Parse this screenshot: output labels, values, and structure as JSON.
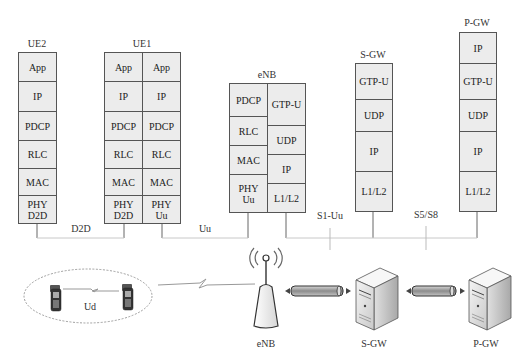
{
  "nodes": {
    "ue2": {
      "label": "UE2",
      "columns": [
        {
          "layers": [
            "App",
            "IP",
            "PDCP",
            "RLC",
            "MAC",
            "PHY\nD2D"
          ]
        }
      ]
    },
    "ue1": {
      "label": "UE1",
      "columns": [
        {
          "layers": [
            "App",
            "IP",
            "PDCP",
            "RLC",
            "MAC",
            "PHY\nD2D"
          ]
        },
        {
          "layers": [
            "App",
            "IP",
            "PDCP",
            "RLC",
            "MAC",
            "PHY\nUu"
          ]
        }
      ]
    },
    "enb": {
      "label": "eNB",
      "columns": [
        {
          "layers": [
            "PDCP",
            "RLC",
            "MAC",
            "PHY\nUu"
          ]
        },
        {
          "layers": [
            "GTP-U",
            "UDP",
            "IP",
            "L1/L2"
          ]
        }
      ]
    },
    "sgw": {
      "label": "S-GW",
      "columns": [
        {
          "layers": [
            "GTP-U",
            "UDP",
            "IP",
            "L1/L2"
          ]
        }
      ]
    },
    "pgw": {
      "label": "P-GW",
      "columns": [
        {
          "layers": [
            "IP",
            "GTP-U",
            "UDP",
            "IP",
            "L1/L2"
          ]
        }
      ]
    }
  },
  "interfaces": {
    "d2d": "D2D",
    "uu": "Uu",
    "s1u": "S1-Uu",
    "s5s8": "S5/S8",
    "ud": "Ud"
  },
  "devices": {
    "enb": "eNB",
    "sgw": "S-GW",
    "pgw": "P-GW"
  },
  "colors": {
    "stack_fill": "#ececec",
    "stack_border": "#555555",
    "link_line": "#bbbbbb",
    "tube_fill": "#9a9a9a"
  }
}
